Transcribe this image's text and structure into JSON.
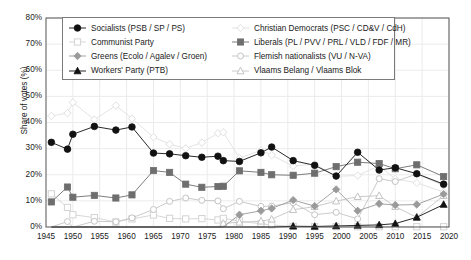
{
  "chart_data": {
    "type": "line",
    "title": "",
    "xlabel": "",
    "ylabel": "Share of votes (%)",
    "xlim": [
      1945,
      2020
    ],
    "ylim": [
      0,
      80
    ],
    "xticks": [
      1945,
      1950,
      1955,
      1960,
      1965,
      1970,
      1975,
      1980,
      1985,
      1990,
      1995,
      2000,
      2005,
      2010,
      2015,
      2020
    ],
    "xtick_labels": [
      "1945",
      "1950",
      "1955",
      "1960",
      "1965",
      "1970",
      "1975",
      "1980",
      "1985",
      "1990",
      "1995",
      "2000",
      "2005",
      "2010",
      "2015",
      "2020"
    ],
    "yticks": [
      0,
      10,
      20,
      30,
      40,
      50,
      60,
      70,
      80
    ],
    "ytick_labels": [
      "0%",
      "10%",
      "20%",
      "30%",
      "40%",
      "50%",
      "60%",
      "70%",
      "80%"
    ],
    "grid": true,
    "legend_position": "upper-center",
    "x": [
      1946,
      1949,
      1950,
      1954,
      1958,
      1961,
      1965,
      1968,
      1971,
      1974,
      1977,
      1978,
      1981,
      1985,
      1987,
      1991,
      1995,
      1999,
      2003,
      2007,
      2010,
      2014,
      2019
    ],
    "series": [
      {
        "name": "Socialists (PSB / SP / PS)",
        "marker": "circle-filled",
        "color": "#111111",
        "values": [
          32.4,
          29.8,
          35.5,
          38.5,
          37.1,
          38.3,
          28.3,
          28.0,
          27.3,
          26.7,
          27.1,
          25.4,
          25.1,
          28.4,
          30.6,
          25.4,
          23.6,
          19.5,
          28.6,
          21.8,
          22.7,
          20.4,
          16.4
        ]
      },
      {
        "name": "Communist Party",
        "marker": "square-open",
        "color": "#d3d3d3",
        "values": [
          12.7,
          7.5,
          4.7,
          3.6,
          1.9,
          3.1,
          4.6,
          3.3,
          3.1,
          3.2,
          2.7,
          3.3,
          2.3,
          1.2,
          0.8,
          0.2,
          0.1,
          0.1,
          0.1,
          0.1,
          0.1,
          0.1,
          0.1
        ]
      },
      {
        "name": "Greens (Ecolo / Agalev / Groen)",
        "marker": "diamond-grey",
        "color": "#9a9a9a",
        "values": [
          0,
          0,
          0,
          0,
          0,
          0,
          0,
          0,
          0,
          0,
          0,
          0,
          4.7,
          6.2,
          7.1,
          10.3,
          8.0,
          14.4,
          6.2,
          8.9,
          8.4,
          8.6,
          12.6
        ]
      },
      {
        "name": "Workers' Party (PTB)",
        "marker": "triangle-filled",
        "color": "#111111",
        "values": [
          0,
          0,
          0,
          0,
          0,
          0,
          0,
          0,
          0,
          0,
          0,
          0,
          0,
          0,
          0,
          0.3,
          0.2,
          0.4,
          0.6,
          0.8,
          1.3,
          3.7,
          8.6
        ]
      },
      {
        "name": "Christian Democrats (PSC / CD&V / CdH)",
        "marker": "diamond-open",
        "color": "#e0e0e0",
        "values": [
          42.5,
          43.6,
          47.7,
          41.1,
          46.5,
          41.5,
          34.4,
          31.7,
          30.1,
          32.3,
          35.9,
          36.3,
          26.4,
          29.3,
          27.5,
          23.3,
          24.1,
          19.4,
          19.7,
          23.4,
          18.4,
          16.9,
          13.4
        ]
      },
      {
        "name": "Liberals (PL / PVV / PRL / VLD / FDF / MR)",
        "marker": "square-filled",
        "color": "#6e6e6e",
        "values": [
          9.6,
          15.3,
          11.4,
          12.1,
          11.1,
          12.3,
          21.6,
          20.9,
          16.4,
          15.2,
          15.5,
          15.6,
          21.5,
          20.9,
          20.0,
          19.8,
          20.6,
          23.1,
          24.8,
          24.3,
          22.3,
          23.8,
          19.3
        ]
      },
      {
        "name": "Flemish nationalists (VU / N-VA)",
        "marker": "circle-open",
        "color": "#c4c4c4",
        "values": [
          0,
          2.1,
          0,
          2.2,
          2.0,
          3.5,
          6.7,
          9.8,
          11.1,
          10.2,
          10.0,
          7.0,
          9.8,
          7.9,
          8.0,
          9.3,
          4.7,
          5.6,
          3.1,
          18.5,
          17.4,
          20.3,
          16.0
        ]
      },
      {
        "name": "Vlaams Belang / Vlaams Blok",
        "marker": "triangle-open",
        "color": "#c4c4c4",
        "values": [
          0,
          0,
          0,
          0,
          0,
          0,
          0,
          0,
          0,
          0,
          0,
          1.4,
          1.8,
          2.2,
          3.0,
          6.6,
          7.8,
          9.9,
          11.6,
          12.0,
          7.8,
          3.7,
          12.0
        ]
      }
    ]
  },
  "axes": {
    "y_label": "Share of votes (%)",
    "y_ticks": [
      "0%",
      "10%",
      "20%",
      "30%",
      "40%",
      "50%",
      "60%",
      "70%",
      "80%"
    ],
    "x_ticks": [
      "1945",
      "1950",
      "1955",
      "1960",
      "1965",
      "1970",
      "1975",
      "1980",
      "1985",
      "1990",
      "1995",
      "2000",
      "2005",
      "2010",
      "2015",
      "2020"
    ]
  },
  "legend": {
    "left_column": [
      {
        "label": "Socialists (PSB / SP / PS)",
        "marker": "circle-filled",
        "icon": "legend-marker-circle-filled-icon"
      },
      {
        "label": "Communist Party",
        "marker": "square-open",
        "icon": "legend-marker-square-open-icon"
      },
      {
        "label": "Greens (Ecolo / Agalev / Groen)",
        "marker": "diamond-grey",
        "icon": "legend-marker-diamond-grey-icon"
      },
      {
        "label": "Workers' Party (PTB)",
        "marker": "triangle-filled",
        "icon": "legend-marker-triangle-filled-icon"
      }
    ],
    "right_column": [
      {
        "label": "Christian Democrats (PSC / CD&V / CdH)",
        "marker": "diamond-open",
        "icon": "legend-marker-diamond-open-icon"
      },
      {
        "label": "Liberals (PL / PVV / PRL / VLD / FDF / MR)",
        "marker": "square-filled",
        "icon": "legend-marker-square-filled-icon"
      },
      {
        "label": "Flemish nationalists (VU / N-VA)",
        "marker": "circle-open",
        "icon": "legend-marker-circle-open-icon"
      },
      {
        "label": "Vlaams Belang / Vlaams Blok",
        "marker": "triangle-open",
        "icon": "legend-marker-triangle-open-icon"
      }
    ]
  },
  "colors": {
    "socialists": "#111111",
    "communist": "#d3d3d3",
    "greens": "#9a9a9a",
    "workers": "#111111",
    "christian_democrats": "#e0e0e0",
    "liberals": "#6e6e6e",
    "flemish_nationalists": "#c4c4c4",
    "vlaams_belang": "#c4c4c4",
    "axis": "#555555",
    "grid": "#ebebeb",
    "background": "#ffffff"
  }
}
